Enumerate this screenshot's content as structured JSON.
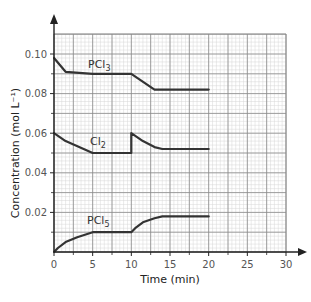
{
  "chart_data": {
    "type": "line",
    "title": "",
    "xlabel": "Time (min)",
    "ylabel": "Concentration (mol L⁻¹)",
    "xlim": [
      0,
      30
    ],
    "ylim": [
      0,
      0.11
    ],
    "x_ticks": [
      0,
      5,
      10,
      15,
      20,
      25,
      30
    ],
    "x_tick_labels": [
      "0",
      "5",
      "10",
      "15",
      "20",
      "25",
      "30"
    ],
    "y_ticks": [
      0.02,
      0.04,
      0.06,
      0.08,
      0.1
    ],
    "y_tick_labels": [
      "0.02",
      "0.04",
      "0.06",
      "0.08",
      "0.10"
    ],
    "grid": true,
    "legend_position": "inline labels",
    "series": [
      {
        "name": "PCl3",
        "label_main": "PCl",
        "label_sub": "3",
        "color": "#333333",
        "points": [
          [
            0,
            0.098
          ],
          [
            1.5,
            0.091
          ],
          [
            5,
            0.09
          ],
          [
            10,
            0.09
          ],
          [
            13,
            0.082
          ],
          [
            20,
            0.082
          ]
        ]
      },
      {
        "name": "Cl2",
        "label_main": "Cl",
        "label_sub": "2",
        "color": "#333333",
        "points": [
          [
            0,
            0.06
          ],
          [
            1.5,
            0.056
          ],
          [
            5,
            0.05
          ],
          [
            10,
            0.05
          ],
          [
            10,
            0.06
          ],
          [
            11.5,
            0.056
          ],
          [
            13,
            0.053
          ],
          [
            14,
            0.052
          ],
          [
            20,
            0.052
          ]
        ]
      },
      {
        "name": "PCl5",
        "label_main": "PCl",
        "label_sub": "5",
        "color": "#333333",
        "points": [
          [
            0,
            0.0
          ],
          [
            0.5,
            0.002
          ],
          [
            1.5,
            0.005
          ],
          [
            3,
            0.0075
          ],
          [
            5,
            0.01
          ],
          [
            10,
            0.01
          ],
          [
            10.5,
            0.012
          ],
          [
            11.5,
            0.015
          ],
          [
            13,
            0.017
          ],
          [
            14,
            0.018
          ],
          [
            20,
            0.018
          ]
        ]
      }
    ]
  },
  "colors": {
    "minor_grid": "#d6d6d6",
    "major_grid": "#8a8a8a",
    "axis": "#222222",
    "tick_label": "#555555"
  }
}
